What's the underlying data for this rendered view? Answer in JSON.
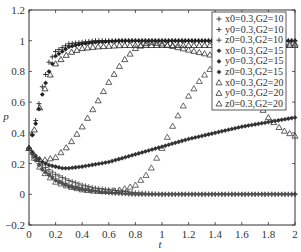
{
  "chart_data": {
    "type": "scatter",
    "title": "",
    "xlabel": "t",
    "ylabel": "p",
    "xlim": [
      0,
      2
    ],
    "ylim": [
      -0.2,
      1.2
    ],
    "xticks": [
      "0",
      "0.2",
      "0.4",
      "0.6",
      "0.8",
      "1",
      "1.2",
      "1.4",
      "1.6",
      "1.8",
      "2"
    ],
    "yticks": [
      "-0.2",
      "0",
      "0.2",
      "0.4",
      "0.6",
      "0.8",
      "1",
      "1.2"
    ],
    "grid": false,
    "legend_position": "upper right",
    "series": [
      {
        "name": "x0=0.3,G2=10",
        "marker": "plus",
        "x": [
          0,
          0.05,
          0.1,
          0.15,
          0.2,
          0.3,
          0.4,
          0.5,
          0.7,
          1.0,
          1.5,
          2.0
        ],
        "y": [
          0.3,
          0.48,
          0.7,
          0.86,
          0.93,
          0.98,
          0.99,
          1.0,
          1.0,
          1.0,
          1.0,
          1.0
        ]
      },
      {
        "name": "y0=0.3,G2=10",
        "marker": "plus",
        "x": [
          0,
          0.05,
          0.1,
          0.2,
          0.3,
          0.4,
          0.5,
          0.6,
          0.8,
          1.0,
          1.5,
          2.0
        ],
        "y": [
          0.3,
          0.24,
          0.19,
          0.13,
          0.09,
          0.06,
          0.04,
          0.03,
          0.01,
          0.0,
          0.0,
          0.0
        ]
      },
      {
        "name": "z0=0.3,G2=10",
        "marker": "plus",
        "x": [
          0,
          0.05,
          0.1,
          0.2,
          0.3,
          0.4,
          0.5,
          0.6,
          0.8,
          1.0,
          1.5,
          2.0
        ],
        "y": [
          0.3,
          0.23,
          0.17,
          0.1,
          0.06,
          0.04,
          0.02,
          0.01,
          0.0,
          0.0,
          0.0,
          0.0
        ]
      },
      {
        "name": "x0=0.3,G2=15",
        "marker": "star",
        "x": [
          0,
          0.02,
          0.05,
          0.1,
          0.15,
          0.2,
          0.3,
          0.4,
          0.5,
          0.7,
          1.0,
          1.5,
          2.0
        ],
        "y": [
          0.3,
          0.37,
          0.46,
          0.65,
          0.8,
          0.9,
          0.96,
          0.98,
          0.99,
          1.0,
          1.0,
          1.0,
          1.0
        ]
      },
      {
        "name": "y0=0.3,G2=15",
        "marker": "star",
        "x": [
          0,
          0.05,
          0.1,
          0.2,
          0.3,
          0.4,
          0.5,
          0.6,
          0.8,
          1.0,
          1.5,
          2.0
        ],
        "y": [
          0.3,
          0.22,
          0.16,
          0.09,
          0.05,
          0.03,
          0.02,
          0.01,
          0.0,
          0.0,
          0.0,
          0.0
        ]
      },
      {
        "name": "z0=0.3,G2=15",
        "marker": "star",
        "x": [
          0,
          0.05,
          0.1,
          0.15,
          0.2,
          0.25,
          0.3,
          0.4,
          0.6,
          0.8,
          1.0,
          1.2,
          1.4,
          1.6,
          1.8,
          2.0
        ],
        "y": [
          0.3,
          0.25,
          0.21,
          0.19,
          0.18,
          0.17,
          0.17,
          0.18,
          0.21,
          0.26,
          0.31,
          0.36,
          0.4,
          0.44,
          0.47,
          0.5
        ]
      },
      {
        "name": "x0=0.3,G2=20",
        "marker": "triangle",
        "x": [
          0,
          0.05,
          0.1,
          0.15,
          0.2,
          0.3,
          0.4,
          0.5,
          0.7,
          1.0,
          1.5,
          2.0
        ],
        "y": [
          0.3,
          0.45,
          0.64,
          0.76,
          0.85,
          0.92,
          0.95,
          0.96,
          0.97,
          0.97,
          0.97,
          0.97
        ]
      },
      {
        "name": "y0=0.3,G2=20",
        "marker": "triangle",
        "x": [
          0,
          0.05,
          0.1,
          0.2,
          0.3,
          0.4,
          0.5,
          0.6,
          0.7,
          0.8,
          0.9,
          1.0,
          1.2,
          1.4,
          1.6,
          1.7,
          1.8,
          1.9,
          2.0
        ],
        "y": [
          0.3,
          0.24,
          0.22,
          0.24,
          0.32,
          0.44,
          0.58,
          0.73,
          0.86,
          0.95,
          0.99,
          0.98,
          0.94,
          0.9,
          0.77,
          0.62,
          0.5,
          0.42,
          0.38
        ]
      },
      {
        "name": "z0=0.3,G2=20",
        "marker": "triangle",
        "x": [
          0,
          0.05,
          0.1,
          0.2,
          0.3,
          0.4,
          0.5,
          0.6,
          0.7,
          0.8,
          0.9,
          1.0,
          1.1,
          1.2,
          1.3,
          1.4,
          1.5,
          1.6,
          1.7,
          1.8,
          1.9,
          2.0
        ],
        "y": [
          0.3,
          0.22,
          0.15,
          0.08,
          0.05,
          0.03,
          0.02,
          0.02,
          0.03,
          0.06,
          0.14,
          0.3,
          0.48,
          0.64,
          0.76,
          0.85,
          0.91,
          0.94,
          0.96,
          0.97,
          0.98,
          0.98
        ]
      }
    ]
  },
  "legend": {
    "entries": [
      {
        "symbol": "+",
        "label": "x0=0.3,G2=10"
      },
      {
        "symbol": "+",
        "label": "y0=0.3,G2=10"
      },
      {
        "symbol": "+",
        "label": "z0=0.3,G2=10"
      },
      {
        "symbol": "*",
        "label": "x0=0.3,G2=15"
      },
      {
        "symbol": "*",
        "label": "y0=0.3,G2=15"
      },
      {
        "symbol": "*",
        "label": "z0=0.3,G2=15"
      },
      {
        "symbol": "△",
        "label": "x0=0.3,G2=20"
      },
      {
        "symbol": "△",
        "label": "y0=0.3,G2=20"
      },
      {
        "symbol": "△",
        "label": "z0=0.3,G2=20"
      }
    ]
  },
  "axes": {
    "xlabel": "t",
    "ylabel": "p"
  }
}
